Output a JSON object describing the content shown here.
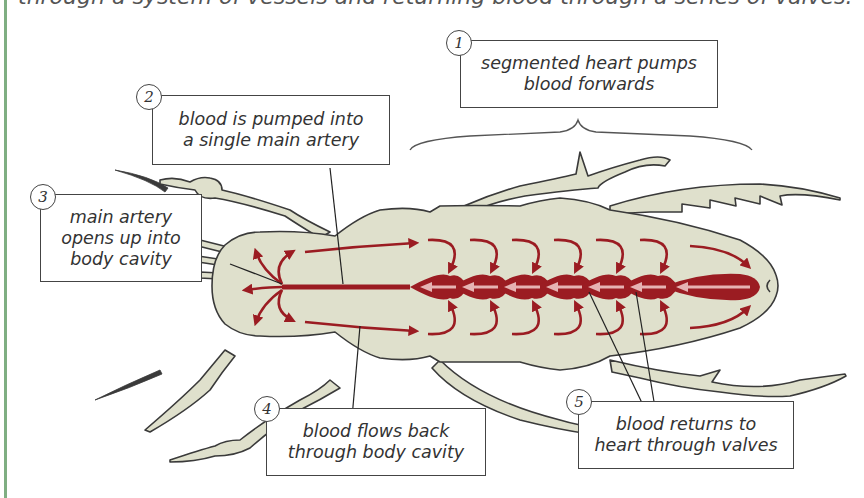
{
  "page": {
    "top_line_partial": "through a system of vessels and returning blood through a series of valves."
  },
  "colors": {
    "border_accent": "#7fae82",
    "body_fill": "#dfe0cc",
    "outline": "#3a3a3a",
    "blood_red": "#9b1c22",
    "heart_arrow": "#e6b3b3",
    "box_border": "#444444",
    "text": "#333333"
  },
  "labels": [
    {
      "number": "1",
      "text_line1": "segmented heart pumps",
      "text_line2": "blood forwards"
    },
    {
      "number": "2",
      "text_line1": "blood is pumped into",
      "text_line2": "a single main artery"
    },
    {
      "number": "3",
      "text_line1": "main artery",
      "text_line2": "opens up into",
      "text_line3": "body cavity"
    },
    {
      "number": "4",
      "text_line1": "blood flows back",
      "text_line2": "through body cavity"
    },
    {
      "number": "5",
      "text_line1": "blood returns to",
      "text_line2": "heart through valves"
    }
  ],
  "figure": {
    "heart_segments": 7,
    "icon": "insect-body-illustration"
  }
}
